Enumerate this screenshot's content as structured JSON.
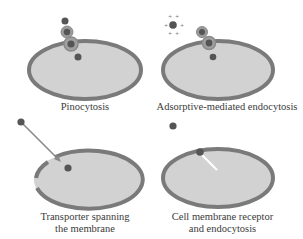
{
  "panels": [
    {
      "id": "pinocytosis",
      "label": "Pinocytosis"
    },
    {
      "id": "adsorptive",
      "label": "Adsorptive-mediated endocytosis",
      "charge_marks": [
        "+",
        "+",
        "+",
        "+",
        "+",
        "+"
      ]
    },
    {
      "id": "transporter",
      "label_line1": "Transporter spanning",
      "label_line2": "the membrane"
    },
    {
      "id": "receptor",
      "label_line1": "Cell membrane receptor",
      "label_line2": "and endocytosis"
    }
  ],
  "colors": {
    "membrane": "#7a7a7a",
    "cytoplasm": "#d2d2d2",
    "particle": "#555555",
    "vesicle_ring": "#8c8c8c",
    "arrow": "#888888",
    "receptor_line": "#ffffff",
    "text": "#3a3a3a"
  }
}
